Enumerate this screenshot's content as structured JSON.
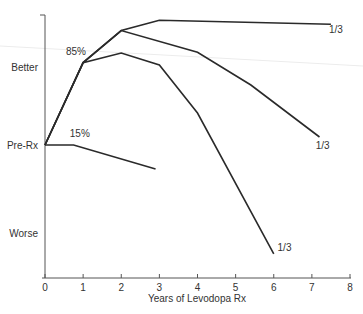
{
  "chart_data": {
    "type": "line",
    "title": "",
    "xlabel": "Years of Levodopa Rx",
    "ylabel": "",
    "xlim": [
      0,
      8
    ],
    "x_ticks": [
      0,
      1,
      2,
      3,
      4,
      5,
      6,
      7,
      8
    ],
    "x_tick_labels": [
      "0",
      "1",
      "2",
      "3",
      "4",
      "5",
      "6",
      "7",
      "8"
    ],
    "y_category_labels": [
      {
        "label": "Better",
        "value": 1
      },
      {
        "label": "Pre-Rx",
        "value": 0
      },
      {
        "label": "Worse",
        "value": -1
      }
    ],
    "ylim": [
      -1.65,
      1.6
    ],
    "grid": false,
    "legend": null,
    "series": [
      {
        "name": "Responders (85%) - sustained",
        "end_label": "1/3",
        "points": [
          [
            0,
            0
          ],
          [
            1,
            1.03
          ],
          [
            2,
            1.43
          ],
          [
            3,
            1.56
          ],
          [
            7.5,
            1.51
          ]
        ]
      },
      {
        "name": "Responders (85%) - gradual decline",
        "end_label": "1/3",
        "points": [
          [
            0,
            0
          ],
          [
            1,
            1.03
          ],
          [
            2,
            1.43
          ],
          [
            4,
            1.16
          ],
          [
            5.4,
            0.75
          ],
          [
            7.2,
            0.1
          ]
        ]
      },
      {
        "name": "Responders (85%) - rapid decline",
        "end_label": "1/3",
        "points": [
          [
            0,
            0
          ],
          [
            1,
            1.03
          ],
          [
            2,
            1.15
          ],
          [
            3,
            1.0
          ],
          [
            4,
            0.4
          ],
          [
            6,
            -1.36
          ]
        ]
      },
      {
        "name": "Non-responders (15%)",
        "end_label": "",
        "points": [
          [
            0,
            0
          ],
          [
            0.75,
            0
          ],
          [
            2.9,
            -0.3
          ]
        ]
      }
    ],
    "annotations": [
      {
        "text": "85%",
        "x": 0.55,
        "y": 1.12
      },
      {
        "text": "15%",
        "x": 0.65,
        "y": 0.1
      },
      {
        "text": "1/3",
        "x": 7.45,
        "y": 1.4
      },
      {
        "text": "1/3",
        "x": 7.1,
        "y": -0.05
      },
      {
        "text": "1/3",
        "x": 6.1,
        "y": -1.33
      }
    ]
  }
}
